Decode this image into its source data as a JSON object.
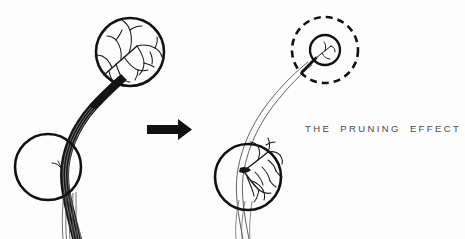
{
  "figure": {
    "title": "THE PRUNING EFFECT",
    "caption": "THE PRUNING EFFECT",
    "background_color": "#fdfdfd",
    "ink_color": "#111111",
    "caption_color": "#4a4a4a",
    "panels": [
      {
        "id": "before",
        "name": "before-pruning",
        "position": "left",
        "description": "Branch with dense twig growth at the tip",
        "stem": {
          "style": "thick-tapered",
          "stroke_color": "#111111"
        },
        "magnifiers": [
          {
            "id": "before-tip-magnifier",
            "type": "solid-circle",
            "cx": 130,
            "cy": 52,
            "r": 34,
            "stroke_width": 2.6,
            "contents": "dense-branching-twigs"
          },
          {
            "id": "before-base-magnifier",
            "type": "solid-circle",
            "cx": 48,
            "cy": 167,
            "r": 33,
            "stroke_width": 2.6,
            "contents": "bare-trunk-with-small-stub"
          }
        ]
      },
      {
        "id": "after",
        "name": "after-pruning",
        "position": "right",
        "description": "Pruned branch: tip growth removed, base growth increased",
        "stem": {
          "style": "thin-double-line",
          "stroke_color": "#555555"
        },
        "magnifiers": [
          {
            "id": "after-tip-magnifier",
            "type": "solid-circle",
            "cx": 325,
            "cy": 50,
            "r": 15,
            "stroke_width": 2.2,
            "contents": "cut-stub-minimal-growth"
          },
          {
            "id": "after-tip-highlight",
            "type": "dashed-circle",
            "cx": 325,
            "cy": 50,
            "r": 33,
            "stroke_width": 2.6,
            "dash_pattern": "7 5",
            "contents": "emphasis-ring"
          },
          {
            "id": "after-base-magnifier",
            "type": "solid-circle",
            "cx": 248,
            "cy": 177,
            "r": 33,
            "stroke_width": 2.6,
            "contents": "dense-branching-twigs"
          }
        ]
      }
    ],
    "arrow": {
      "id": "transition-arrow",
      "label": "",
      "direction": "right",
      "x": 147,
      "y": 129,
      "length": 43,
      "color": "#111111"
    }
  }
}
